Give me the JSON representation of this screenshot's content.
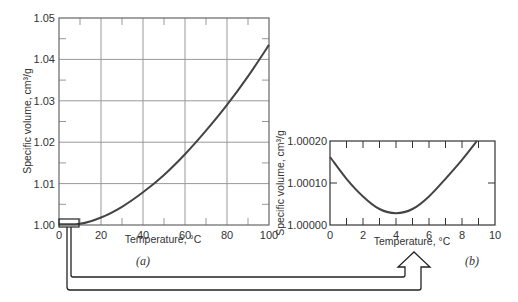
{
  "chart_data": [
    {
      "id": "a",
      "type": "line",
      "caption": "(a)",
      "title": "",
      "xlabel": "Temperature, °C",
      "ylabel": "Specific volume, cm³/g",
      "xlim": [
        0,
        100
      ],
      "ylim": [
        1.0,
        1.05
      ],
      "xticks": [
        "0",
        "20",
        "40",
        "60",
        "80",
        "100"
      ],
      "yticks": [
        "1.00",
        "1.01",
        "1.02",
        "1.03",
        "1.04",
        "1.05"
      ],
      "grid": true,
      "series": [
        {
          "name": "Specific volume of water",
          "x": [
            0,
            10,
            20,
            30,
            40,
            50,
            60,
            70,
            80,
            90,
            100
          ],
          "y": [
            1.0002,
            1.0003,
            1.0018,
            1.0044,
            1.0079,
            1.0121,
            1.0171,
            1.0228,
            1.029,
            1.0359,
            1.0435
          ]
        }
      ],
      "annotations": [
        "Small box at 0–10 °C near 1.00 enlarged in (b)"
      ]
    },
    {
      "id": "b",
      "type": "line",
      "caption": "(b)",
      "title": "",
      "xlabel": "Temperature, °C",
      "ylabel": "Specific volume, cm³/g",
      "xlim": [
        0,
        10
      ],
      "ylim": [
        1.0,
        1.0002
      ],
      "xticks": [
        "0",
        "2",
        "4",
        "6",
        "8",
        "10"
      ],
      "yticks": [
        "1.00000",
        "1.00010",
        "1.00020"
      ],
      "grid": false,
      "series": [
        {
          "name": "Specific volume of water (0–10 °C)",
          "x": [
            0,
            1,
            2,
            3,
            4,
            5,
            6,
            7,
            8,
            8.9
          ],
          "y": [
            1.000162,
            1.00011,
            1.000068,
            1.000038,
            1.000028,
            1.000038,
            1.000068,
            1.00011,
            1.000155,
            1.0002
          ]
        }
      ]
    }
  ]
}
